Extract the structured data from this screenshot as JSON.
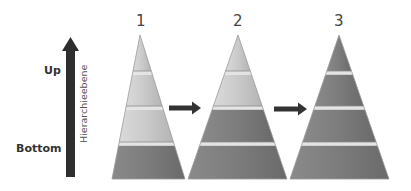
{
  "axis": {
    "up_label": "Up",
    "bottom_label": "Bottom",
    "vertical_label": "Hierarchieebene",
    "arrow_color": "#2e2e2e"
  },
  "pyramids": [
    {
      "label": "1",
      "levels_top_to_bottom": [
        "light",
        "light",
        "light",
        "dark"
      ]
    },
    {
      "label": "2",
      "levels_top_to_bottom": [
        "light",
        "light",
        "dark",
        "dark"
      ]
    },
    {
      "label": "3",
      "levels_top_to_bottom": [
        "dark",
        "dark",
        "dark",
        "dark"
      ]
    }
  ],
  "colors": {
    "light": "#c9c9c9",
    "dark": "#7b7b7b",
    "separator": "#e4e4e4",
    "transition_arrow": "#333333"
  }
}
